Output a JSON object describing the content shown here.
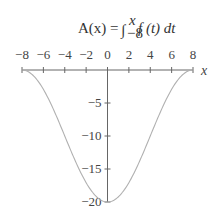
{
  "chart_data": {
    "type": "line",
    "title_parts": {
      "lhs": "A(x) =",
      "integral": "∫",
      "upper": "x",
      "lower": "−8",
      "integrand": "f (t) dt"
    },
    "xlabel": "x",
    "ylabel": "",
    "xlim": [
      -8,
      8
    ],
    "ylim": [
      -20,
      0
    ],
    "x_ticks": [
      -8,
      -6,
      -4,
      -2,
      0,
      2,
      4,
      6,
      8
    ],
    "x_tick_labels": [
      "−8",
      "−6",
      "−4",
      "−2",
      "0",
      "2",
      "4",
      "6",
      "8"
    ],
    "y_ticks": [
      -5,
      -10,
      -15,
      -20
    ],
    "y_tick_labels": [
      "−5",
      "−10",
      "−15",
      "−20"
    ],
    "grid": false,
    "legend": null,
    "series": [
      {
        "name": "A(x)",
        "x": [
          -8,
          -7,
          -6,
          -5,
          -4,
          -3,
          -2,
          -1,
          0,
          1,
          2,
          3,
          4,
          5,
          6,
          7,
          8
        ],
        "values": [
          0,
          -0.8,
          -2.9,
          -6.2,
          -10,
          -13.8,
          -17.1,
          -19.2,
          -20,
          -19.2,
          -17.1,
          -13.8,
          -10,
          -6.2,
          -2.9,
          -0.8,
          0
        ]
      }
    ],
    "colors": {
      "axis": "#666666",
      "curve": "#b0b0b0",
      "text": "#333333"
    }
  }
}
